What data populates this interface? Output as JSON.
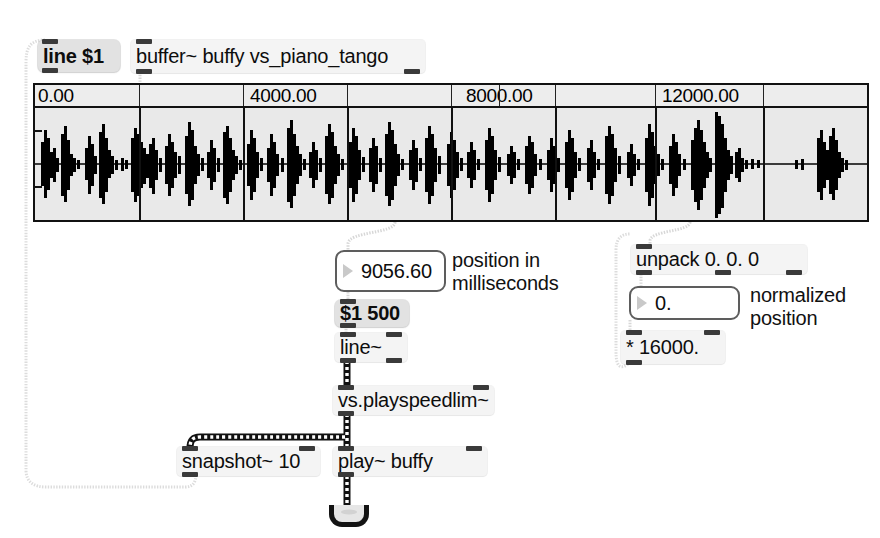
{
  "app": {
    "title": "Max/MSP patcher",
    "background": "#ffffff"
  },
  "objects": {
    "line_msg": {
      "text": "line $1",
      "kind": "message"
    },
    "buffer": {
      "text": "buffer~ buffy vs_piano_tango",
      "kind": "object"
    },
    "position_number": {
      "value": "9056.60",
      "kind": "number-box"
    },
    "ramp_msg": {
      "text": "$1 500",
      "kind": "message"
    },
    "line_signal": {
      "text": "line~",
      "kind": "object"
    },
    "playspeedlim": {
      "text": "vs.playspeedlim~",
      "kind": "object"
    },
    "snapshot": {
      "text": "snapshot~ 10",
      "kind": "object"
    },
    "play": {
      "text": "play~ buffy",
      "kind": "object"
    },
    "unpack": {
      "text": "unpack 0. 0. 0",
      "kind": "object"
    },
    "normalized_number": {
      "value": "0.",
      "kind": "number-box"
    },
    "multiply": {
      "text": "* 16000.",
      "kind": "object"
    },
    "dac": {
      "label": "ezdac~",
      "kind": "speaker"
    }
  },
  "comments": {
    "position_ms": "position in\nmilliseconds",
    "normalized_position": "normalized\nposition"
  },
  "waveform": {
    "ruler_labels": [
      {
        "text": "0.00",
        "x_pct": 0.0
      },
      {
        "text": "4000.00",
        "x_pct": 25.8
      },
      {
        "text": "8000.00",
        "x_pct": 52.6
      },
      {
        "text": "12000.00",
        "x_pct": 76.3
      }
    ],
    "gridline_pct": [
      12.8,
      25.5,
      38.3,
      50.9,
      63.5,
      76.0,
      88.3
    ],
    "background": "#e9e9e9",
    "border_color": "#111111",
    "wave_color": "#000000"
  },
  "colors": {
    "object_fill": "#f4f4f4",
    "message_fill": "#e2e2e2",
    "number_fill": "#ffffff",
    "nub": "#3a3a3a",
    "signal_cord": "#111111",
    "control_cord": "#cfcfcf"
  }
}
